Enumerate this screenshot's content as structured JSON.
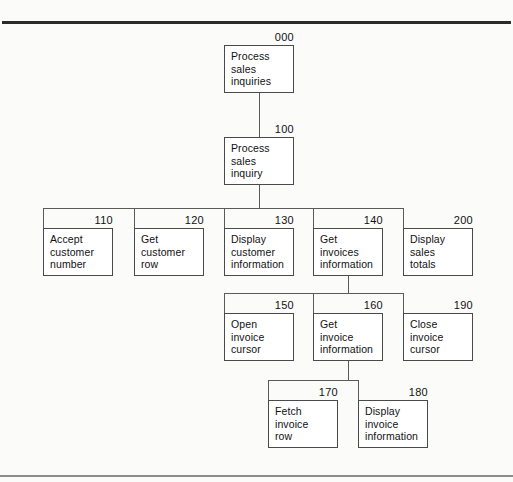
{
  "diagram": {
    "type": "structure-chart",
    "nodes": [
      {
        "id": "000",
        "number": "000",
        "label": "Process\nsales\ninquiries",
        "level": 0,
        "x": 224,
        "y": 45
      },
      {
        "id": "100",
        "number": "100",
        "label": "Process\nsales\ninquiry",
        "level": 1,
        "x": 224,
        "y": 137
      },
      {
        "id": "110",
        "number": "110",
        "label": "Accept\ncustomer\nnumber",
        "level": 2,
        "x": 43,
        "y": 228
      },
      {
        "id": "120",
        "number": "120",
        "label": "Get\ncustomer\nrow",
        "level": 2,
        "x": 134,
        "y": 228
      },
      {
        "id": "130",
        "number": "130",
        "label": "Display\ncustomer\ninformation",
        "level": 2,
        "x": 224,
        "y": 228
      },
      {
        "id": "140",
        "number": "140",
        "label": "Get\ninvoices\ninformation",
        "level": 2,
        "x": 313,
        "y": 228
      },
      {
        "id": "200",
        "number": "200",
        "label": "Display\nsales\ntotals",
        "level": 2,
        "x": 403,
        "y": 228
      },
      {
        "id": "150",
        "number": "150",
        "label": "Open\ninvoice\ncursor",
        "level": 3,
        "x": 224,
        "y": 313
      },
      {
        "id": "160",
        "number": "160",
        "label": "Get\ninvoice\ninformation",
        "level": 3,
        "x": 313,
        "y": 313
      },
      {
        "id": "190",
        "number": "190",
        "label": "Close\ninvoice\ncursor",
        "level": 3,
        "x": 403,
        "y": 313
      },
      {
        "id": "170",
        "number": "170",
        "label": "Fetch\ninvoice\nrow",
        "level": 4,
        "x": 268,
        "y": 400
      },
      {
        "id": "180",
        "number": "180",
        "label": "Display\ninvoice\ninformation",
        "level": 4,
        "x": 358,
        "y": 400
      }
    ],
    "edges": [
      {
        "from": "000",
        "to": "100"
      },
      {
        "from": "100",
        "to": "110"
      },
      {
        "from": "100",
        "to": "120"
      },
      {
        "from": "100",
        "to": "130"
      },
      {
        "from": "100",
        "to": "140"
      },
      {
        "from": "100",
        "to": "200"
      },
      {
        "from": "140",
        "to": "150"
      },
      {
        "from": "140",
        "to": "160"
      },
      {
        "from": "140",
        "to": "190"
      },
      {
        "from": "160",
        "to": "170"
      },
      {
        "from": "160",
        "to": "180"
      }
    ],
    "colors": {
      "box_fill": "#ffffff",
      "box_border": "#4a4a4a",
      "line": "#5a5a5a",
      "text": "#111111",
      "page": "#fbfbfa",
      "rule_top": "#2b2b2b",
      "rule_bottom": "#8c8c8c"
    }
  }
}
